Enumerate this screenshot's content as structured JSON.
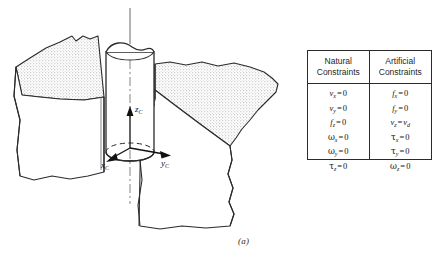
{
  "figure": {
    "caption": "(a)",
    "axes": [
      {
        "name": "z-axis-label",
        "base": "z",
        "sub": "C"
      },
      {
        "name": "x-axis-label",
        "base": "x",
        "sub": "C"
      },
      {
        "name": "y-axis-label",
        "base": "y",
        "sub": "C"
      }
    ],
    "colors": {
      "outline": "#2b2b2b",
      "stipple_fill": "#d8d8d8",
      "face_fill": "#ffffff",
      "centerline": "#555555"
    },
    "description_parts": [
      "peg",
      "hole-block-left",
      "hole-block-right",
      "compliance-frame"
    ]
  },
  "table": {
    "headers": [
      {
        "line1": "Natural",
        "line2": "Constraints"
      },
      {
        "line1": "Artificial",
        "line2": "Constraints"
      }
    ],
    "natural": [
      {
        "lhs_sym": "v",
        "lhs_sub": "x",
        "op": "=",
        "rhs_sym": "",
        "rhs_val": "0",
        "rhs_sub": ""
      },
      {
        "lhs_sym": "v",
        "lhs_sub": "y",
        "op": "=",
        "rhs_sym": "",
        "rhs_val": "0",
        "rhs_sub": ""
      },
      {
        "lhs_sym": "f",
        "lhs_sub": "z",
        "op": "=",
        "rhs_sym": "",
        "rhs_val": "0",
        "rhs_sub": ""
      },
      {
        "lhs_sym": "ω",
        "lhs_sub": "x",
        "op": "=",
        "rhs_sym": "",
        "rhs_val": "0",
        "rhs_sub": ""
      },
      {
        "lhs_sym": "ω",
        "lhs_sub": "y",
        "op": "=",
        "rhs_sym": "",
        "rhs_val": "0",
        "rhs_sub": ""
      },
      {
        "lhs_sym": "τ",
        "lhs_sub": "z",
        "op": "=",
        "rhs_sym": "",
        "rhs_val": "0",
        "rhs_sub": ""
      }
    ],
    "artificial": [
      {
        "lhs_sym": "f",
        "lhs_sub": "x",
        "op": "=",
        "rhs_sym": "",
        "rhs_val": "0",
        "rhs_sub": ""
      },
      {
        "lhs_sym": "f",
        "lhs_sub": "y",
        "op": "=",
        "rhs_sym": "",
        "rhs_val": "0",
        "rhs_sub": ""
      },
      {
        "lhs_sym": "v",
        "lhs_sub": "z",
        "op": "=",
        "rhs_sym": "v",
        "rhs_val": "",
        "rhs_sub": "d"
      },
      {
        "lhs_sym": "τ",
        "lhs_sub": "x",
        "op": "=",
        "rhs_sym": "",
        "rhs_val": "0",
        "rhs_sub": ""
      },
      {
        "lhs_sym": "τ",
        "lhs_sub": "y",
        "op": "=",
        "rhs_sym": "",
        "rhs_val": "0",
        "rhs_sub": ""
      },
      {
        "lhs_sym": "ω",
        "lhs_sub": "z",
        "op": "=",
        "rhs_sym": "",
        "rhs_val": "0",
        "rhs_sub": ""
      }
    ]
  }
}
